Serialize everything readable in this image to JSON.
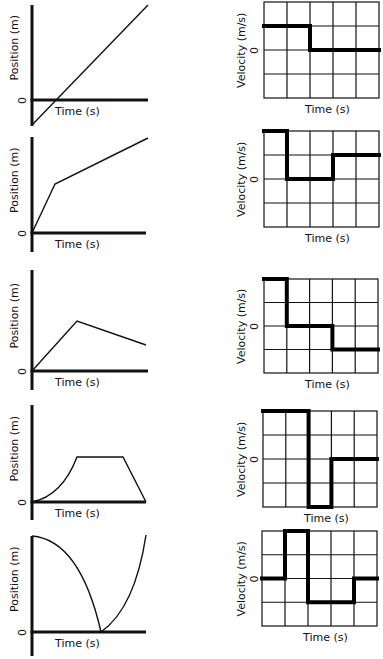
{
  "labels": {
    "position_axis": "Position (m)",
    "velocity_axis": "Velocity (m/s)",
    "time_axis": "Time (s)",
    "zero": "0"
  },
  "colors": {
    "ink": "#111111",
    "background": "#ffffff"
  },
  "chart_data": [
    {
      "type": "line",
      "title": "Position-time graph 1",
      "xlabel": "Time (s)",
      "ylabel": "Position (m)",
      "description": "straight line starting below zero, constant positive slope",
      "points_px": [
        [
          32,
          125
        ],
        [
          148,
          5
        ]
      ],
      "axis_px": {
        "x0": 32,
        "top": 5,
        "zero_y": 100,
        "bottom": 126,
        "x_end": 148
      }
    },
    {
      "type": "line",
      "title": "Position-time graph 2",
      "xlabel": "Time (s)",
      "ylabel": "Position (m)",
      "description": "steep positive slope then lesser positive slope",
      "points_px": [
        [
          32,
          233
        ],
        [
          55,
          184
        ],
        [
          148,
          138
        ]
      ],
      "axis_px": {
        "x0": 32,
        "top": 137,
        "zero_y": 233,
        "bottom": 252,
        "x_end": 146
      }
    },
    {
      "type": "line",
      "title": "Position-time graph 3",
      "xlabel": "Time (s)",
      "ylabel": "Position (m)",
      "description": "positive slope then negative slope",
      "points_px": [
        [
          32,
          371
        ],
        [
          77,
          321
        ],
        [
          146,
          345
        ]
      ],
      "axis_px": {
        "x0": 32,
        "top": 270,
        "zero_y": 371,
        "bottom": 390,
        "x_end": 148
      }
    },
    {
      "type": "line",
      "title": "Position-time graph 4",
      "xlabel": "Time (s)",
      "ylabel": "Position (m)",
      "description": "curve upward (accelerating), flat, then straight down to zero",
      "path": "M32,502 Q62,496 77,457 L123,457 L146,502",
      "axis_px": {
        "x0": 32,
        "top": 405,
        "zero_y": 502,
        "bottom": 520,
        "x_end": 146
      }
    },
    {
      "type": "line",
      "title": "Position-time graph 5",
      "xlabel": "Time (s)",
      "ylabel": "Position (m)",
      "description": "starts high, curves down to zero, then curves up",
      "path": "M32,536 Q80,540 101,632 Q135,608 146,535",
      "axis_px": {
        "x0": 32,
        "top": 536,
        "zero_y": 632,
        "bottom": 656,
        "x_end": 146
      }
    },
    {
      "type": "line",
      "title": "Velocity-time graph A",
      "xlabel": "Time (s)",
      "ylabel": "Velocity (m/s)",
      "grid": {
        "cols": 5,
        "rows": 4,
        "zero_row": 2
      },
      "step_values": [
        1,
        1,
        0,
        0,
        0
      ],
      "grid_px": {
        "x": 264,
        "y": 2,
        "w": 115,
        "h": 96
      }
    },
    {
      "type": "line",
      "title": "Velocity-time graph B",
      "xlabel": "Time (s)",
      "ylabel": "Velocity (m/s)",
      "grid": {
        "cols": 5,
        "rows": 4,
        "zero_row": 2
      },
      "step_values": [
        2,
        0,
        0,
        1,
        1
      ],
      "grid_px": {
        "x": 264,
        "y": 131,
        "w": 115,
        "h": 96
      }
    },
    {
      "type": "line",
      "title": "Velocity-time graph C",
      "xlabel": "Time (s)",
      "ylabel": "Velocity (m/s)",
      "grid": {
        "cols": 5,
        "rows": 4,
        "zero_row": 2
      },
      "step_values": [
        2,
        0,
        0,
        -1,
        -1
      ],
      "grid_px": {
        "x": 264,
        "y": 279,
        "w": 114,
        "h": 94
      }
    },
    {
      "type": "line",
      "title": "Velocity-time graph D",
      "xlabel": "Time (s)",
      "ylabel": "Velocity (m/s)",
      "grid": {
        "cols": 5,
        "rows": 4,
        "zero_row": 2
      },
      "step_values": [
        2,
        2,
        -2,
        0,
        0
      ],
      "grid_px": {
        "x": 263,
        "y": 411,
        "w": 114,
        "h": 96
      }
    },
    {
      "type": "line",
      "title": "Velocity-time graph E",
      "xlabel": "Time (s)",
      "ylabel": "Velocity (m/s)",
      "grid": {
        "cols": 5,
        "rows": 4,
        "zero_row": 2
      },
      "step_values": [
        0,
        2,
        -1,
        -1,
        0
      ],
      "grid_px": {
        "x": 262,
        "y": 531,
        "w": 115,
        "h": 95
      }
    }
  ]
}
